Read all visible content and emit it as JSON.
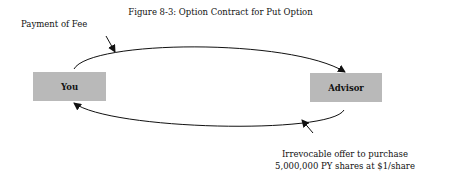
{
  "figure": {
    "title": "Figure 8-3: Option Contract for Put Option",
    "nodes": [
      {
        "id": "you",
        "label": "You"
      },
      {
        "id": "advisor",
        "label": "Advisor"
      }
    ],
    "edges": [
      {
        "from": "you",
        "to": "advisor",
        "label": "Payment of Fee"
      },
      {
        "from": "advisor",
        "to": "you",
        "label_line1": "Irrevocable offer to purchase",
        "label_line2": "5,000,000 PY shares at $1/share"
      }
    ]
  }
}
